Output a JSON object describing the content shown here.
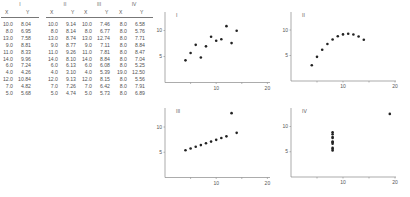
{
  "table": {
    "groups": [
      {
        "label": "I",
        "x_header": "X",
        "y_header": "Y",
        "x": [
          "10.0",
          "8.0",
          "13.0",
          "9.0",
          "11.0",
          "14.0",
          "6.0",
          "4.0",
          "12.0",
          "7.0",
          "5.0"
        ],
        "y": [
          "8.04",
          "6.95",
          "7.58",
          "8.81",
          "8.33",
          "9.96",
          "7.24",
          "4.26",
          "10.84",
          "4.82",
          "5.68"
        ]
      },
      {
        "label": "II",
        "x_header": "X",
        "y_header": "Y",
        "x": [
          "10.0",
          "8.0",
          "13.0",
          "9.0",
          "11.0",
          "14.0",
          "6.0",
          "4.0",
          "12.0",
          "7.0",
          "5.0"
        ],
        "y": [
          "9.14",
          "8.14",
          "8.74",
          "8.77",
          "9.26",
          "8.10",
          "6.13",
          "3.10",
          "9.13",
          "7.26",
          "4.74"
        ]
      },
      {
        "label": "III",
        "x_header": "X",
        "y_header": "Y",
        "x": [
          "10.0",
          "8.0",
          "13.0",
          "9.0",
          "11.0",
          "14.0",
          "6.0",
          "4.0",
          "12.0",
          "7.0",
          "5.0"
        ],
        "y": [
          "7.46",
          "6.77",
          "12.74",
          "7.11",
          "7.81",
          "8.84",
          "6.08",
          "5.39",
          "8.15",
          "6.42",
          "5.73"
        ]
      },
      {
        "label": "IV",
        "x_header": "X",
        "y_header": "Y",
        "x": [
          "8.0",
          "8.0",
          "8.0",
          "8.0",
          "8.0",
          "8.0",
          "8.0",
          "19.0",
          "8.0",
          "8.0",
          "8.0"
        ],
        "y": [
          "6.58",
          "5.76",
          "7.71",
          "8.84",
          "8.47",
          "7.04",
          "5.25",
          "12.50",
          "5.56",
          "7.91",
          "6.89"
        ]
      }
    ]
  },
  "chart_data": [
    {
      "type": "scatter",
      "title": "I",
      "x": [
        10,
        8,
        13,
        9,
        11,
        14,
        6,
        4,
        12,
        7,
        5
      ],
      "y": [
        8.04,
        6.95,
        7.58,
        8.81,
        8.33,
        9.96,
        7.24,
        4.26,
        10.84,
        4.82,
        5.68
      ],
      "xticks": [
        "10",
        "20"
      ],
      "yticks": [
        "5",
        "10"
      ],
      "xlim": [
        0,
        20
      ],
      "ylim": [
        0,
        13
      ],
      "grid": false
    },
    {
      "type": "scatter",
      "title": "II",
      "x": [
        10,
        8,
        13,
        9,
        11,
        14,
        6,
        4,
        12,
        7,
        5
      ],
      "y": [
        9.14,
        8.14,
        8.74,
        8.77,
        9.26,
        8.1,
        6.13,
        3.1,
        9.13,
        7.26,
        4.74
      ],
      "xticks": [
        "10",
        "20"
      ],
      "yticks": [
        "5",
        "10"
      ],
      "xlim": [
        0,
        20
      ],
      "ylim": [
        0,
        13
      ],
      "grid": false
    },
    {
      "type": "scatter",
      "title": "III",
      "x": [
        10,
        8,
        13,
        9,
        11,
        14,
        6,
        4,
        12,
        7,
        5
      ],
      "y": [
        7.46,
        6.77,
        12.74,
        7.11,
        7.81,
        8.84,
        6.08,
        5.39,
        8.15,
        6.42,
        5.73
      ],
      "xticks": [
        "10",
        "20"
      ],
      "yticks": [
        "5",
        "10"
      ],
      "xlim": [
        0,
        20
      ],
      "ylim": [
        0,
        13
      ],
      "grid": false
    },
    {
      "type": "scatter",
      "title": "IV",
      "x": [
        8,
        8,
        8,
        8,
        8,
        8,
        8,
        19,
        8,
        8,
        8
      ],
      "y": [
        6.58,
        5.76,
        7.71,
        8.84,
        8.47,
        7.04,
        5.25,
        12.5,
        5.56,
        7.91,
        6.89
      ],
      "xticks": [
        "10",
        "20"
      ],
      "yticks": [
        "5",
        "10"
      ],
      "xlim": [
        0,
        20
      ],
      "ylim": [
        0,
        13
      ],
      "grid": false
    }
  ],
  "colors": {
    "axis": "#888888",
    "point": "#222222",
    "text": "#555555"
  }
}
